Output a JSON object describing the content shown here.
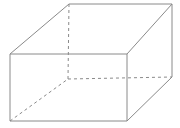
{
  "figure": {
    "type": "cuboid-wireframe",
    "background": "#ffffff",
    "stroke_color": "#8a8a8a",
    "stroke_width": 1,
    "dash_pattern": "3,3",
    "canvas": {
      "width": 180,
      "height": 128
    },
    "vertices": {
      "front_top_left": [
        10,
        54
      ],
      "front_top_right": [
        127,
        54
      ],
      "front_bottom_left": [
        10,
        121
      ],
      "front_bottom_right": [
        127,
        121
      ],
      "back_top_left": [
        69,
        4
      ],
      "back_top_right": [
        172,
        4
      ],
      "back_bottom_left": [
        68,
        79
      ],
      "back_bottom_right": [
        172,
        77
      ]
    },
    "edges": [
      {
        "from": "front_top_left",
        "to": "front_top_right",
        "style": "solid"
      },
      {
        "from": "front_top_right",
        "to": "front_bottom_right",
        "style": "solid"
      },
      {
        "from": "front_bottom_right",
        "to": "front_bottom_left",
        "style": "solid"
      },
      {
        "from": "front_bottom_left",
        "to": "front_top_left",
        "style": "solid"
      },
      {
        "from": "front_top_left",
        "to": "back_top_left",
        "style": "solid"
      },
      {
        "from": "front_top_right",
        "to": "back_top_right",
        "style": "solid"
      },
      {
        "from": "back_top_left",
        "to": "back_top_right",
        "style": "solid"
      },
      {
        "from": "back_top_right",
        "to": "back_bottom_right",
        "style": "solid"
      },
      {
        "from": "front_bottom_right",
        "to": "back_bottom_right",
        "style": "solid"
      },
      {
        "from": "front_bottom_left",
        "to": "back_bottom_left",
        "style": "dashed"
      },
      {
        "from": "back_bottom_left",
        "to": "back_bottom_right",
        "style": "dashed"
      },
      {
        "from": "back_bottom_left",
        "to": "back_top_left",
        "style": "dashed"
      }
    ]
  }
}
